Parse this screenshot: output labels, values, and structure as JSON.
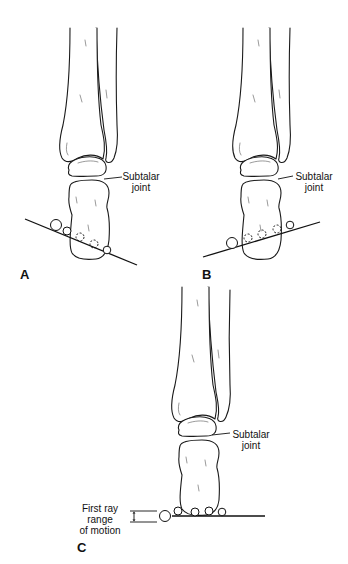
{
  "figure": {
    "panels": [
      {
        "letter": "A",
        "label_line1": "Subtalar",
        "label_line2": "joint",
        "description": "Hindfoot in varus; ground line tilted down to the right"
      },
      {
        "letter": "B",
        "label_line1": "Subtalar",
        "label_line2": "joint",
        "description": "Hindfoot in valgus; ground line tilted up to the right"
      },
      {
        "letter": "C",
        "label_line1": "Subtalar",
        "label_line2": "joint",
        "description": "Neutral hindfoot; level ground line",
        "range_label_line1": "First ray",
        "range_label_line2": "range",
        "range_label_line3": "of motion"
      }
    ],
    "colors": {
      "line": "#111111",
      "background": "#ffffff"
    }
  }
}
